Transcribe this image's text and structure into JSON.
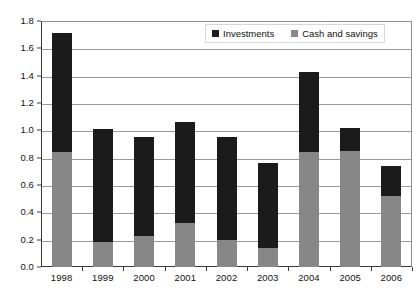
{
  "chart_data": {
    "type": "bar",
    "title": "",
    "subtitle": "",
    "xlabel": "",
    "ylabel": "",
    "stacked": true,
    "grid": true,
    "legend_position": "top-right",
    "categories": [
      "1998",
      "1999",
      "2000",
      "2001",
      "2002",
      "2003",
      "2004",
      "2005",
      "2006"
    ],
    "ylim": [
      0.0,
      1.8
    ],
    "ytick_values": [
      0.0,
      0.2,
      0.4,
      0.6,
      0.8,
      1.0,
      1.2,
      1.4,
      1.6,
      1.8
    ],
    "ytick_labels": [
      "0.0",
      "0.2",
      "0.4",
      "0.6",
      "0.8",
      "1.0",
      "1.2",
      "1.4",
      "1.6",
      "1.8"
    ],
    "series": [
      {
        "name": "Cash and savings",
        "color": "#878787",
        "values": [
          0.84,
          0.18,
          0.23,
          0.32,
          0.2,
          0.14,
          0.84,
          0.85,
          0.52
        ]
      },
      {
        "name": "Investments",
        "color": "#1b1b1b",
        "values": [
          0.87,
          0.83,
          0.72,
          0.74,
          0.75,
          0.62,
          0.59,
          0.17,
          0.22
        ]
      }
    ],
    "totals": [
      1.71,
      1.01,
      0.95,
      1.06,
      0.95,
      0.76,
      1.43,
      1.02,
      0.74
    ]
  },
  "legend": {
    "items": [
      {
        "label": "Investments",
        "swatch": "black-square-icon"
      },
      {
        "label": "Cash and savings",
        "swatch": "gray-square-icon"
      }
    ]
  },
  "caption": {
    "text": ""
  }
}
